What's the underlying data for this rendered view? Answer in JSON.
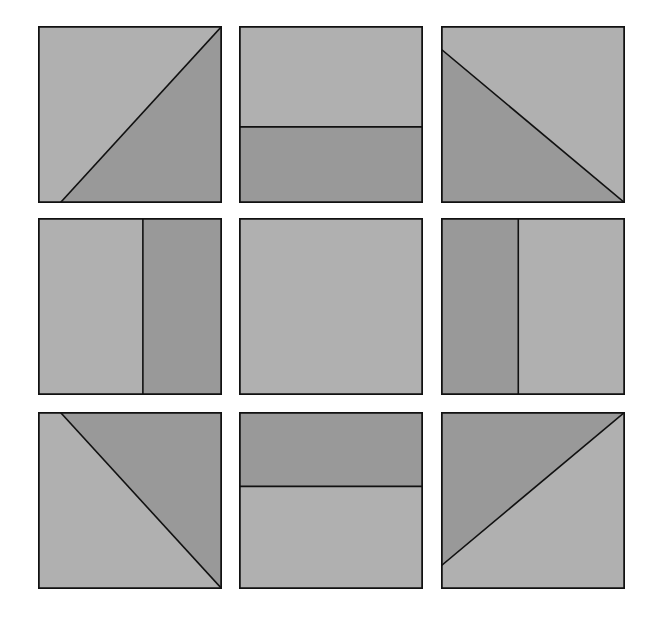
{
  "diagram": {
    "title": "",
    "colors": {
      "light": "#b0b0b0",
      "dark": "#999999",
      "stroke": "#111111",
      "background": "#ffffff"
    },
    "grid": {
      "columns_x": [
        38,
        239,
        441
      ],
      "rows_y": [
        26,
        218,
        412
      ],
      "tile_width": 184,
      "tile_height": 177
    },
    "tiles": [
      {
        "id": 1,
        "name": "tile-diagonal-bottom-right-dark",
        "row": 0,
        "col": 0,
        "dark_polygon": "12,100 100,0 100,100",
        "line": [
          12,
          100,
          100,
          0
        ]
      },
      {
        "id": 2,
        "name": "tile-horizontal-bottom-dark",
        "row": 0,
        "col": 1,
        "dark_polygon": "0,57 100,57 100,100 0,100",
        "line": [
          0,
          57,
          100,
          57
        ]
      },
      {
        "id": 3,
        "name": "tile-diagonal-bottom-left-dark",
        "row": 0,
        "col": 2,
        "dark_polygon": "0,13 100,100 0,100",
        "line": [
          0,
          13,
          100,
          100
        ]
      },
      {
        "id": 4,
        "name": "tile-vertical-right-dark",
        "row": 1,
        "col": 0,
        "dark_polygon": "57,0 100,0 100,100 57,100",
        "line": [
          57,
          0,
          57,
          100
        ]
      },
      {
        "id": 5,
        "name": "tile-plain",
        "row": 1,
        "col": 1,
        "dark_polygon": "",
        "line": null
      },
      {
        "id": 6,
        "name": "tile-vertical-left-dark",
        "row": 1,
        "col": 2,
        "dark_polygon": "0,0 42,0 42,100 0,100",
        "line": [
          42,
          0,
          42,
          100
        ]
      },
      {
        "id": 7,
        "name": "tile-diagonal-top-right-dark",
        "row": 2,
        "col": 0,
        "dark_polygon": "12,0 100,0 100,100",
        "line": [
          12,
          0,
          100,
          100
        ]
      },
      {
        "id": 8,
        "name": "tile-horizontal-top-dark",
        "row": 2,
        "col": 1,
        "dark_polygon": "0,0 100,0 100,42 0,42",
        "line": [
          0,
          42,
          100,
          42
        ]
      },
      {
        "id": 9,
        "name": "tile-diagonal-top-left-dark",
        "row": 2,
        "col": 2,
        "dark_polygon": "0,0 100,0 0,87",
        "line": [
          0,
          87,
          100,
          0
        ]
      }
    ]
  }
}
